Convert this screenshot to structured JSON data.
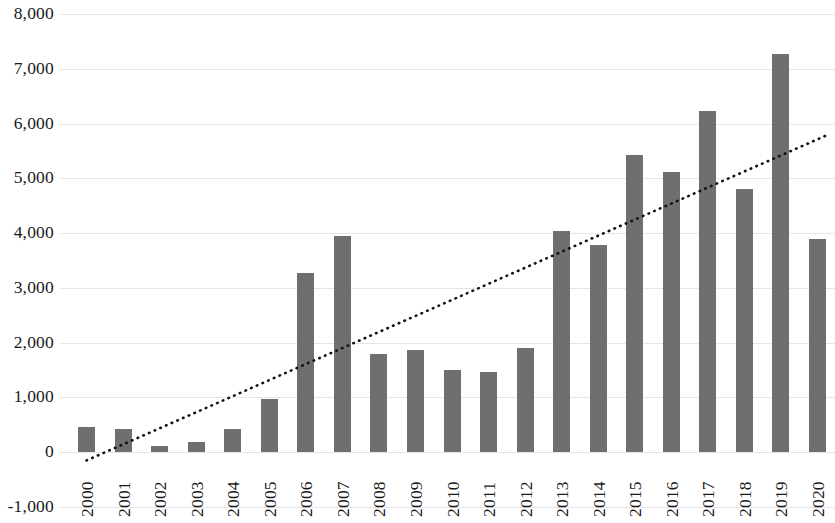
{
  "chart_data": {
    "type": "bar",
    "title": "",
    "subtitle": "",
    "xlabel": "",
    "ylabel": "",
    "categories": [
      "2000",
      "2001",
      "2002",
      "2003",
      "2004",
      "2005",
      "2006",
      "2007",
      "2008",
      "2009",
      "2010",
      "2011",
      "2012",
      "2013",
      "2014",
      "2015",
      "2016",
      "2017",
      "2018",
      "2019",
      "2020"
    ],
    "series": [
      {
        "name": "Value",
        "type": "bar",
        "color": "#6f6f6f",
        "values": [
          460,
          430,
          110,
          190,
          420,
          980,
          3280,
          3940,
          1790,
          1860,
          1500,
          1460,
          1900,
          4040,
          3780,
          5430,
          5120,
          6230,
          4800,
          7270,
          3900
        ]
      },
      {
        "name": "Linear trendline",
        "type": "line",
        "style": "dotted",
        "color": "#111111",
        "endpoints": [
          {
            "x_category": "2000",
            "y": -150
          },
          {
            "x_category": "2020",
            "y": 5800
          }
        ]
      }
    ],
    "ylim": [
      -1000,
      8000
    ],
    "y_ticks": [
      -1000,
      0,
      1000,
      2000,
      3000,
      4000,
      5000,
      6000,
      7000,
      8000
    ],
    "y_tick_labels": [
      "-1,000",
      "0",
      "1,000",
      "2,000",
      "3,000",
      "4,000",
      "5,000",
      "6,000",
      "7,000",
      "8,000"
    ],
    "grid": true,
    "grid_axis": "y",
    "legend": false,
    "legend_position": "none",
    "background_color": "#ffffff",
    "gridline_color": "#e6e6e6"
  }
}
